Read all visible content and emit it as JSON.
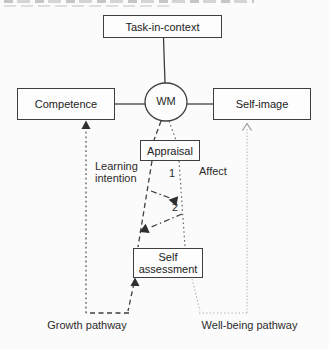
{
  "diagram": {
    "nodes": {
      "task_in_context": "Task-in-context",
      "working_memory": "WM",
      "competence": "Competence",
      "self_image": "Self-image",
      "appraisal": "Appraisal",
      "self_assessment": "Self assessment"
    },
    "edge_labels": {
      "learning_intention": "Learning intention",
      "affect": "Affect",
      "arrow_1": "1",
      "arrow_2": "2"
    },
    "pathway_labels": {
      "growth": "Growth pathway",
      "well_being": "Well-being pathway"
    },
    "colors": {
      "line_dark": "#3f3f3f",
      "line_mid": "#6a6a6a",
      "line_light": "#b3b3b3",
      "box_border": "#3f3f3f",
      "box_fill": "#fdfdfd",
      "text": "#222222",
      "background": "#fbfbfb"
    }
  }
}
